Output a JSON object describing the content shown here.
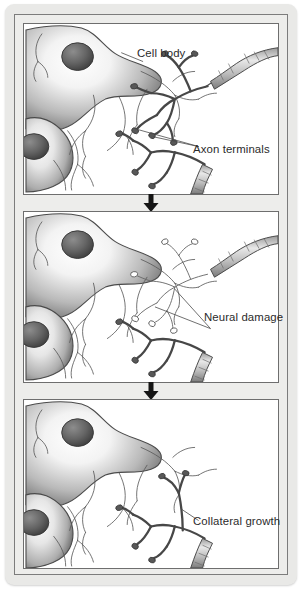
{
  "figure": {
    "panel_count": 3,
    "background_color": "#e9e9e7",
    "panel_background": "#ffffff",
    "frame_border_color": "#7c7c7c",
    "ink_color": "#3a3a3a",
    "label_color": "#2b2b2b"
  },
  "labels": {
    "cell_body": "Cell body",
    "axon_terminals": "Axon terminals",
    "neural_damage": "Neural damage",
    "collateral_growth": "Collateral growth"
  },
  "panels": [
    {
      "id": "panel-1",
      "order": 1,
      "caption": "Intact neuron with healthy axon terminals",
      "labels": [
        "Cell body",
        "Axon terminals"
      ]
    },
    {
      "id": "panel-2",
      "order": 2,
      "caption": "Axon terminals degenerate following injury",
      "labels": [
        "Neural damage"
      ]
    },
    {
      "id": "panel-3",
      "order": 3,
      "caption": "Neighbouring axon sprouts a new collateral branch",
      "labels": [
        "Collateral growth"
      ]
    }
  ],
  "arrows": [
    {
      "id": "arrow-1",
      "direction": "down",
      "from_panel": 1,
      "to_panel": 2
    },
    {
      "id": "arrow-2",
      "direction": "down",
      "from_panel": 2,
      "to_panel": 3
    }
  ]
}
